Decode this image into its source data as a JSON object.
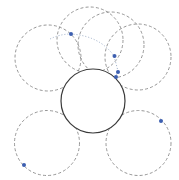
{
  "diagram": {
    "colors": {
      "dashed_circle": "#8a8a8a",
      "solid_circle": "#3a3a3a",
      "marker": "#3d5fb0",
      "path": "#9fb0c8",
      "background": "#ffffff"
    },
    "dashed_circles": [
      {
        "id": "left-upper"
      },
      {
        "id": "top-left"
      },
      {
        "id": "top-middle"
      },
      {
        "id": "right-upper"
      },
      {
        "id": "bottom-left"
      },
      {
        "id": "bottom-right"
      }
    ],
    "solid_circles": [
      {
        "id": "center"
      }
    ],
    "markers": [
      {
        "id": "marker-1"
      },
      {
        "id": "marker-2"
      },
      {
        "id": "marker-3"
      },
      {
        "id": "marker-4"
      },
      {
        "id": "marker-5"
      },
      {
        "id": "marker-6"
      }
    ]
  }
}
